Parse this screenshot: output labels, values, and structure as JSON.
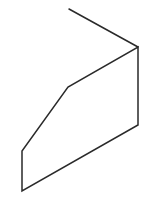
{
  "canvas": {
    "width": 152,
    "height": 206,
    "background": "#ffffff"
  },
  "diagram": {
    "stroke_color": "#2a2a2a",
    "stroke_width": 1.5,
    "lead_line": {
      "x1": 69,
      "y1": 9,
      "x2": 138,
      "y2": 47
    },
    "polygon": {
      "points": [
        [
          138,
          47
        ],
        [
          138,
          125
        ],
        [
          22,
          191
        ],
        [
          22,
          151
        ],
        [
          68,
          87
        ]
      ]
    }
  }
}
